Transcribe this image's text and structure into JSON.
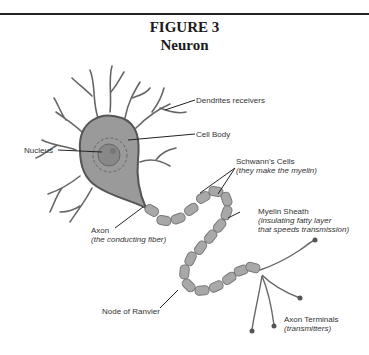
{
  "figure": {
    "number": "FIGURE 3",
    "title": "Neuron"
  },
  "labels": {
    "dendrites": "Dendrites receivers",
    "cell_body": "Cell Body",
    "nucleus": "Nucleus",
    "schwann": {
      "name": "Schwann's Cells",
      "note": "(they make the myelin)"
    },
    "myelin": {
      "name": "Myelin Sheath",
      "note1": "(insulating fatty layer",
      "note2": "that speeds transmission)"
    },
    "axon": {
      "name": "Axon",
      "note": "(the conducting fiber)"
    },
    "node": "Node of Ranvier",
    "terminals": {
      "name": "Axon Terminals",
      "note": "(transmitters)"
    }
  },
  "colors": {
    "cell_fill": "#9a9a9a",
    "cell_stroke": "#555555",
    "nucleus_fill": "#888888",
    "myelin_fill": "#a8a8a8",
    "line": "#222222"
  }
}
